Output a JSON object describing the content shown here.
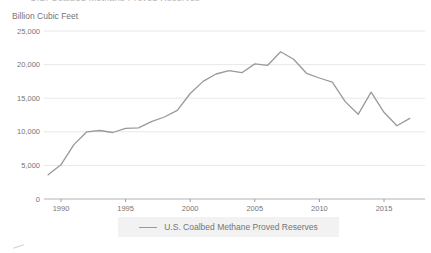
{
  "chart_data": {
    "type": "line",
    "title_clipped": "U.S. Coalbed Methane Proved Reserves",
    "unit_label": "Billion Cubic Feet",
    "xlabel": "",
    "ylabel": "Billion Cubic Feet",
    "x": [
      1989,
      1990,
      1991,
      1992,
      1993,
      1994,
      1995,
      1996,
      1997,
      1998,
      1999,
      2000,
      2001,
      2002,
      2003,
      2004,
      2005,
      2006,
      2007,
      2008,
      2009,
      2010,
      2011,
      2012,
      2013,
      2014,
      2015,
      2016,
      2017
    ],
    "series": [
      {
        "name": "U.S. Coalbed Methane Proved Reserves",
        "values": [
          3600,
          5100,
          8100,
          10000,
          10200,
          9900,
          10500,
          10600,
          11500,
          12200,
          13200,
          15700,
          17500,
          18600,
          19100,
          18800,
          20100,
          19900,
          21900,
          20800,
          18700,
          18000,
          17400,
          14500,
          12600,
          15900,
          12900,
          10900,
          12000
        ]
      }
    ],
    "ylim": [
      0,
      25000
    ],
    "xlim": [
      1988.7,
      2018.2
    ],
    "grid": true,
    "y_ticks": [
      {
        "value": 25000,
        "label": "25,000"
      },
      {
        "value": 20000,
        "label": "20,000"
      },
      {
        "value": 15000,
        "label": "15,000"
      },
      {
        "value": 10000,
        "label": "10,000"
      },
      {
        "value": 5000,
        "label": "5,000"
      },
      {
        "value": 0,
        "label": "0"
      }
    ],
    "x_ticks": [
      {
        "value": 1990,
        "label": "1990"
      },
      {
        "value": 1995,
        "label": "1995"
      },
      {
        "value": 2000,
        "label": "2000"
      },
      {
        "value": 2005,
        "label": "2005"
      },
      {
        "value": 2010,
        "label": "2010"
      },
      {
        "value": 2015,
        "label": "2015"
      }
    ],
    "legend": {
      "position": "bottom-center",
      "entries": [
        {
          "label": "U.S. Coalbed Methane Proved Reserves",
          "color": "#999999"
        }
      ]
    },
    "colors": {
      "background": "#ffffff",
      "series_line": "#999999",
      "grid_line": "#e8e8e8",
      "axis_line": "#b3b3b3",
      "tick_mark": "#9a9a9a",
      "text": "#757575"
    }
  }
}
